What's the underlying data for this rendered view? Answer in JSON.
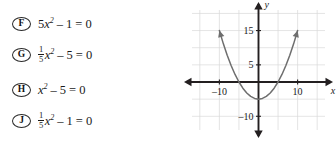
{
  "choices": [
    {
      "letter": "F",
      "label": "5x^2 - 1 = 0",
      "parts": {
        "coef": "5",
        "var": "x",
        "exp": "2",
        "op": "–",
        "const": "1",
        "eq": "=",
        "rhs": "0"
      }
    },
    {
      "letter": "G",
      "label": "1/5 x^2 - 5 = 0",
      "parts": {
        "num": "1",
        "den": "5",
        "var": "x",
        "exp": "2",
        "op": "–",
        "const": "5",
        "eq": "=",
        "rhs": "0"
      }
    },
    {
      "letter": "H",
      "label": "x^2 - 5 = 0",
      "parts": {
        "var": "x",
        "exp": "2",
        "op": "–",
        "const": "5",
        "eq": "=",
        "rhs": "0"
      }
    },
    {
      "letter": "J",
      "label": "1/5 x^2 - 1 = 0",
      "parts": {
        "num": "1",
        "den": "5",
        "var": "x",
        "exp": "2",
        "op": "–",
        "const": "1",
        "eq": "=",
        "rhs": "0"
      }
    }
  ],
  "chart_data": {
    "type": "line",
    "title": "",
    "xlabel": "x",
    "ylabel": "y",
    "xlim": [
      -17,
      17
    ],
    "ylim": [
      -14,
      21
    ],
    "xticks": [
      -10,
      10
    ],
    "yticks": [
      15,
      5,
      -10
    ],
    "xtick_labels": [
      "–10",
      "10"
    ],
    "ytick_labels": [
      "15",
      "5",
      "–10"
    ],
    "grid": true,
    "grid_step": 5,
    "grid_color": "#d8d8d8",
    "axis_color": "#231f20",
    "curve_color": "#6e6e6e",
    "legend": "none",
    "series": [
      {
        "name": "parabola",
        "equation": "y = (1/5)x^2 - 5",
        "vertex": [
          0,
          -5
        ],
        "roots": [
          -5,
          5
        ],
        "points": [
          [
            -10,
            15
          ],
          [
            -9,
            11.2
          ],
          [
            -8,
            7.8
          ],
          [
            -7,
            4.8
          ],
          [
            -6,
            2.2
          ],
          [
            -5,
            0
          ],
          [
            -4,
            -1.8
          ],
          [
            -3,
            -3.2
          ],
          [
            -2,
            -4.2
          ],
          [
            -1,
            -4.8
          ],
          [
            0,
            -5
          ],
          [
            1,
            -4.8
          ],
          [
            2,
            -4.2
          ],
          [
            3,
            -3.2
          ],
          [
            4,
            -1.8
          ],
          [
            5,
            0
          ],
          [
            6,
            2.2
          ],
          [
            7,
            4.8
          ],
          [
            8,
            7.8
          ],
          [
            9,
            11.2
          ],
          [
            10,
            15
          ]
        ]
      }
    ],
    "axis_labels": {
      "x_axis_name": "x",
      "y_axis_name": "y"
    }
  }
}
